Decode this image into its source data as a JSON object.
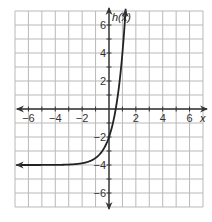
{
  "chart_data": {
    "type": "line",
    "title": "",
    "xlabel": "x",
    "ylabel": "h(x)",
    "xlim": [
      -7,
      7
    ],
    "ylim": [
      -7,
      7
    ],
    "grid": true,
    "x_ticks": [
      -6,
      -4,
      -2,
      2,
      4,
      6
    ],
    "y_ticks": [
      6,
      4,
      2,
      -2,
      -4,
      -6
    ],
    "x_tick_labels": [
      "−6",
      "−4",
      "−2",
      "2",
      "4",
      "6"
    ],
    "y_tick_labels": [
      "6",
      "4",
      "2",
      "−2",
      "−4",
      "−6"
    ],
    "series": [
      {
        "name": "h(x)",
        "function": "h(x) = 2·4^x − 4",
        "horizontal_asymptote": -4,
        "y_intercept": -2,
        "x_intercept": 0.5,
        "x": [
          -7,
          -6,
          -4,
          -2,
          -1,
          0,
          0.5,
          1,
          1.25
        ],
        "values": [
          -4.0,
          -4.0,
          -4.0,
          -3.99,
          -3.5,
          -2,
          0,
          4,
          7.3
        ]
      }
    ]
  },
  "colors": {
    "grid": "#b9b9b9",
    "axis": "#333333",
    "curve": "#222222"
  }
}
